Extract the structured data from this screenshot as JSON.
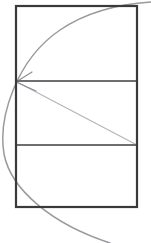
{
  "figure": {
    "canvas": {
      "width": 151,
      "height": 243,
      "background": "#ffffff"
    },
    "colors": {
      "rectangle_stroke": "#3a3a3c",
      "divider_stroke": "#6e6e72",
      "arc_stroke": "#9a9a9e",
      "diagonal_stroke": "#b6b6ba",
      "arrow_stroke": "#8e8e92",
      "background": "#ffffff"
    },
    "strokes": {
      "rectangle_width": 2.2,
      "divider_width": 1.8,
      "arc_width": 1.5,
      "diagonal_width": 1.3,
      "arrow_width": 1.2
    },
    "rectangle": {
      "label": "outer-rectangle",
      "x": 16,
      "y": 6,
      "width": 121,
      "height": 201,
      "right": 137,
      "bottom": 207
    },
    "dividers": [
      {
        "label": "divider-upper",
        "x1": 16,
        "y1": 81,
        "x2": 137,
        "y2": 81
      },
      {
        "label": "divider-lower",
        "x1": 16,
        "y1": 145,
        "x2": 137,
        "y2": 145
      }
    ],
    "bands": [
      {
        "label": "band-top",
        "top": 6,
        "bottom": 81,
        "height": 75
      },
      {
        "label": "band-middle",
        "top": 81,
        "bottom": 145,
        "height": 64
      },
      {
        "label": "band-bottom",
        "top": 145,
        "bottom": 207,
        "height": 62
      }
    ],
    "arc": {
      "label": "construction-arc",
      "path": "M 110 243 C 52 224 11 190 4 154 C -2 118 16 60 60 30 C 88 11 120 4 151 2",
      "description": "sweeping arc entering at top-right, tangent through left edge, exiting bottom"
    },
    "diagonal": {
      "label": "diagonal-line",
      "x1": 137,
      "y1": 145,
      "x2": 17,
      "y2": 82,
      "description": "line from lower divider at right edge to the upper divider at left edge"
    },
    "arrowhead": {
      "label": "arrowhead-at-vertex",
      "tip_x": 16,
      "tip_y": 82,
      "wing_a": {
        "x": 32,
        "y": 72
      },
      "wing_b": {
        "x": 36,
        "y": 91
      },
      "direction": "points-left-toward-vertex"
    }
  }
}
